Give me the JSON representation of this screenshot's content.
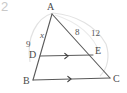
{
  "figure": {
    "number_label": "2",
    "caption": "",
    "background_color": "#ffffff",
    "stroke_color": "#5a5a5a",
    "arc_color": "#e2e2e2",
    "text_color": "#4a4a4a",
    "number_color": "#c9c9c9",
    "width": 127,
    "height": 93
  },
  "vertices": [
    {
      "id": "A",
      "label": "A",
      "x": 52,
      "y": 14,
      "label_x": 47,
      "label_y": 2
    },
    {
      "id": "B",
      "label": "B",
      "x": 33,
      "y": 80,
      "label_x": 23,
      "label_y": 76
    },
    {
      "id": "C",
      "label": "C",
      "x": 110,
      "y": 78,
      "label_x": 113,
      "label_y": 74
    },
    {
      "id": "D",
      "label": "D",
      "x": 40,
      "y": 56,
      "label_x": 29,
      "label_y": 50
    },
    {
      "id": "E",
      "label": "E",
      "x": 93,
      "y": 55,
      "label_x": 95,
      "label_y": 46
    }
  ],
  "segments": [
    {
      "id": "AB",
      "from": "A",
      "to": "B",
      "tick_marks": 0
    },
    {
      "id": "AC",
      "from": "A",
      "to": "C",
      "tick_marks": 0
    },
    {
      "id": "BC",
      "from": "B",
      "to": "C",
      "tick_marks": 1
    },
    {
      "id": "DE",
      "from": "D",
      "to": "E",
      "tick_marks": 1
    }
  ],
  "parallel_marks": [
    {
      "on_segment": "DE",
      "x": 68,
      "y": 56,
      "direction": "right"
    },
    {
      "on_segment": "BC",
      "x": 71,
      "y": 79,
      "direction": "right"
    }
  ],
  "measure_labels": [
    {
      "id": "AD",
      "text": "9",
      "on_segment": "AD",
      "x": 26,
      "y": 39,
      "italic": false
    },
    {
      "id": "DB",
      "text": "x",
      "on_segment": "DB",
      "x": 40,
      "y": 30,
      "italic": true
    },
    {
      "id": "AE",
      "text": "8",
      "on_segment": "AE",
      "x": 75,
      "y": 27,
      "italic": false
    },
    {
      "id": "EC",
      "text": "12",
      "on_segment": "EC",
      "x": 91,
      "y": 28,
      "italic": false
    }
  ],
  "arcs": [
    {
      "id": "arc-left",
      "d": "M 30 62 C 26 38 36 18 53 13"
    },
    {
      "id": "arc-top",
      "d": "M 53 13 C 76 15 96 26 106 44"
    },
    {
      "id": "arc-right",
      "d": "M 106 44 C 110 56 108 68 100 76"
    },
    {
      "id": "arc-inner",
      "d": "M 55 15 C 78 22 94 36 100 54"
    }
  ]
}
